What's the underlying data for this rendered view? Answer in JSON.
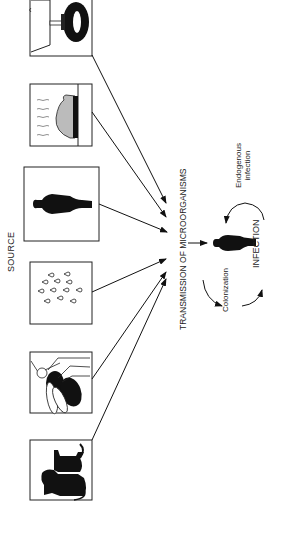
{
  "title_source": "SOURCE",
  "center_label": "TRANSMISSION OF MICROORGANISMS",
  "outcome_label": "INFECTION",
  "cycle_labels": {
    "colonization": "Colonization",
    "endogenous_line1": "Endogenous",
    "endogenous_line2": "infection"
  },
  "sources": [
    {
      "id": "environment-fixtures",
      "icon": "toilet-tap-icon"
    },
    {
      "id": "food",
      "icon": "food-icon"
    },
    {
      "id": "human-carrier",
      "icon": "person-icon"
    },
    {
      "id": "airborne-droplets",
      "icon": "droplets-icon"
    },
    {
      "id": "insect-vector",
      "icon": "insect-icon"
    },
    {
      "id": "animals",
      "icon": "animals-icon"
    }
  ],
  "colors": {
    "ink": "#111111",
    "background": "#ffffff"
  }
}
